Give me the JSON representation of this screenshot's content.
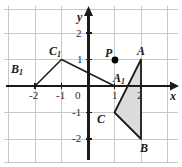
{
  "figure": {
    "background_color": "#ffffff",
    "grid_color": "#c8c8c8",
    "axis_color": "#1a1a1a",
    "shape_stroke_color": "#1a1a1a",
    "shaded_fill_color": "#dcdcdc",
    "point_color": "#000000"
  },
  "axes": {
    "x_label": "x",
    "y_label": "y",
    "origin_label": "0",
    "x_ticks": [
      "-2",
      "-1",
      "1",
      "2"
    ],
    "y_ticks": [
      "2",
      "1",
      "-1",
      "-2"
    ],
    "x_range": [
      -3,
      3
    ],
    "y_range": [
      -2.8,
      2.8
    ]
  },
  "points": {
    "A": {
      "label": "A",
      "x": 2,
      "y": 1
    },
    "B": {
      "label": "B",
      "x": 2,
      "y": -2
    },
    "C": {
      "label": "C",
      "x": 1,
      "y": -1
    },
    "A1": {
      "label": "A",
      "sub": "1",
      "x": 1,
      "y": 0
    },
    "B1": {
      "label": "B",
      "sub": "1",
      "x": -2,
      "y": 0
    },
    "C1": {
      "label": "C",
      "sub": "1",
      "x": -1,
      "y": 1
    },
    "P": {
      "label": "P",
      "x": 1,
      "y": 1,
      "marker": "filled-dot"
    }
  },
  "shapes": {
    "triangle_abc": {
      "name": "triangle-ABC",
      "vertices": "A,B,C",
      "filled": true
    },
    "triangle_a1b1c1": {
      "name": "triangle-A1B1C1",
      "vertices": "A1,B1,C1",
      "filled": false
    }
  }
}
